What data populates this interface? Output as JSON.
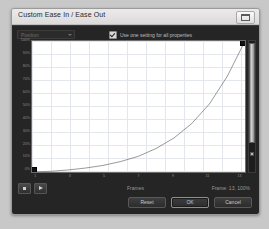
{
  "window": {
    "title": "Custom Ease In / Ease Out",
    "window_button_icon": "restore-icon"
  },
  "toolbar": {
    "property_select_value": "Position",
    "property_select_caret_icon": "chevron-down-icon",
    "use_one_setting_label": "Use one setting for all properties",
    "use_one_setting_checked": true,
    "checkbox_icon": "checkmark-icon"
  },
  "graph": {
    "y_labels": [
      "100%",
      "90%",
      "80%",
      "70%",
      "60%",
      "50%",
      "40%",
      "30%",
      "20%",
      "10%",
      "0%"
    ],
    "x_labels": [
      "1",
      "3",
      "5",
      "7",
      "9",
      "11",
      "13"
    ],
    "start_handle_name": "start-control-point",
    "end_handle_name": "end-control-point"
  },
  "scrollbar": {
    "name": "vertical-scrollbar",
    "thumb_name": "scrollbar-thumb",
    "grip_name": "scrollbar-grip"
  },
  "transport": {
    "stop_icon": "stop-icon",
    "play_icon": "play-icon",
    "frames_label": "Frames",
    "frame_info": "Frame: 13,  100%"
  },
  "footer": {
    "reset_label": "Reset",
    "ok_label": "OK",
    "cancel_label": "Cancel"
  },
  "chart_data": {
    "type": "line",
    "title": "Custom Ease In / Ease Out",
    "xlabel": "Frames",
    "ylabel": "",
    "xlim": [
      1,
      13
    ],
    "ylim": [
      0,
      100
    ],
    "grid": true,
    "legend": null,
    "x": [
      1,
      2,
      3,
      4,
      5,
      6,
      7,
      8,
      9,
      10,
      11,
      12,
      13
    ],
    "values": [
      0,
      0.5,
      1.5,
      3,
      5,
      8,
      12,
      18,
      26,
      37,
      52,
      73,
      100
    ],
    "tick_labels_y": [
      "0%",
      "10%",
      "20%",
      "30%",
      "40%",
      "50%",
      "60%",
      "70%",
      "80%",
      "90%",
      "100%"
    ],
    "tick_labels_x": [
      "1",
      "3",
      "5",
      "7",
      "9",
      "11",
      "13"
    ],
    "curve_kind": "ease-in-exponential",
    "line_color": "#555555",
    "plot_background": "#ffffff",
    "grid_color": "#e3e6ea"
  }
}
